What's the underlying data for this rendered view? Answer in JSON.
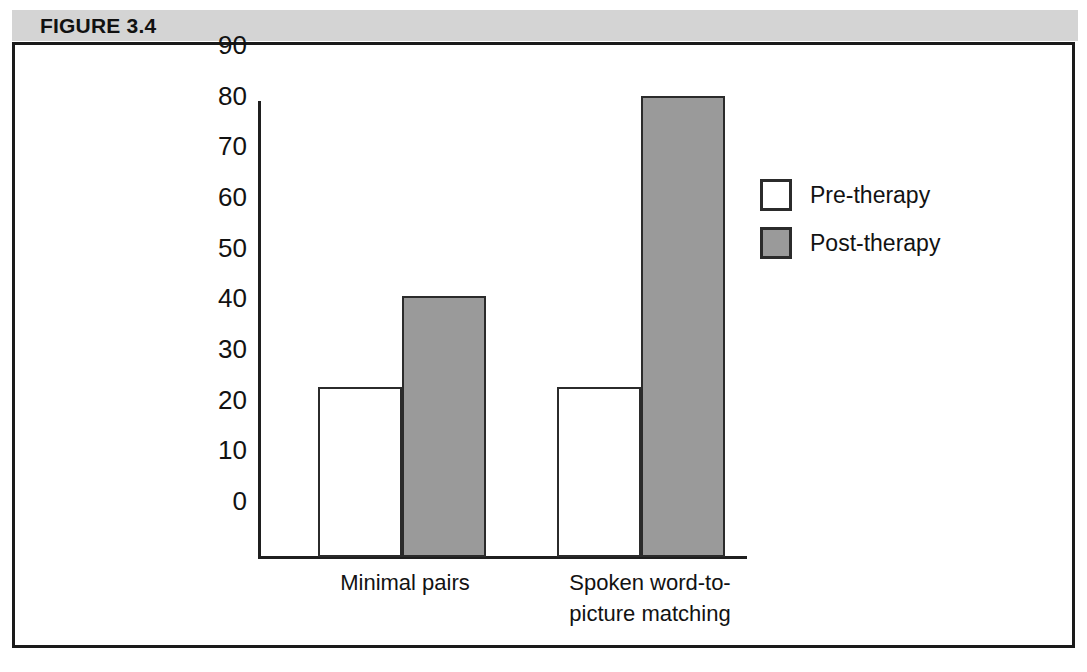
{
  "figure": {
    "header_label": "FIGURE 3.4"
  },
  "legend": {
    "position": "right",
    "items": [
      {
        "label": "Pre-therapy",
        "swatch": "white-square-icon",
        "color": "#ffffff"
      },
      {
        "label": "Post-therapy",
        "swatch": "gray-square-icon",
        "color": "#9a9a9a"
      }
    ]
  },
  "chart_data": {
    "type": "bar",
    "title": "FIGURE 3.4",
    "xlabel": "",
    "ylabel": "",
    "ylim": [
      0,
      90
    ],
    "yticks": [
      0,
      10,
      20,
      30,
      40,
      50,
      60,
      70,
      80,
      90
    ],
    "ytick_labels": [
      "0",
      "10",
      "20",
      "30",
      "40",
      "50",
      "60",
      "70",
      "80",
      "90"
    ],
    "grid": false,
    "categories": [
      "Minimal pairs",
      "Spoken word-to-picture matching"
    ],
    "category_lines": [
      [
        "Minimal pairs"
      ],
      [
        "Spoken word-to-",
        "picture matching"
      ]
    ],
    "series": [
      {
        "name": "Pre-therapy",
        "color": "#ffffff",
        "values": [
          33.5,
          33.5
        ]
      },
      {
        "name": "Post-therapy",
        "color": "#9a9a9a",
        "values": [
          51.5,
          91
        ]
      }
    ]
  }
}
